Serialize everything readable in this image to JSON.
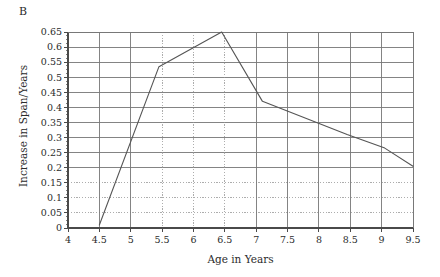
{
  "panel": {
    "label": "B"
  },
  "chart_data": {
    "type": "line",
    "title": "",
    "subtitle": "",
    "xlabel": "Age in Years",
    "ylabel": "Increase in Span/Years",
    "xlim": [
      4,
      9.5
    ],
    "ylim": [
      0,
      0.65
    ],
    "grid": true,
    "legend_position": "none",
    "xticks": [
      4,
      4.5,
      5,
      5.5,
      6,
      6.5,
      7,
      7.5,
      8,
      8.5,
      9,
      9.5
    ],
    "xticklabels": [
      "4",
      "4.5",
      "5",
      "5.5",
      "6",
      "6.5",
      "7",
      "7.5",
      "8",
      "8.5",
      "9",
      "9.5"
    ],
    "yticks": [
      0,
      0.05,
      0.1,
      0.15,
      0.2,
      0.25,
      0.3,
      0.35,
      0.4,
      0.45,
      0.5,
      0.55,
      0.6,
      0.65
    ],
    "yticklabels": [
      "0",
      "0.05",
      "0.1",
      "0.15",
      "0.2",
      "0.25",
      "0.3",
      "0.35",
      "0.4",
      "0.45",
      "0.5",
      "0.55",
      "0.6",
      "0.65"
    ],
    "dotted_ygrid": [
      0.05,
      0.1,
      0.15
    ],
    "dotted_xgrid": [
      5.5,
      6,
      6.5
    ],
    "series": [
      {
        "name": "Increase in Span",
        "color": "#555555",
        "x": [
          4.5,
          5.45,
          6.45,
          7.1,
          8.45,
          9.05,
          9.5
        ],
        "values": [
          0.01,
          0.535,
          0.65,
          0.42,
          0.31,
          0.265,
          0.205
        ]
      }
    ]
  },
  "colors": {
    "axis": "#4a4a4a",
    "grid_solid": "#777777",
    "grid_dotted": "#999999",
    "line": "#555555",
    "text": "#2b2b2b"
  }
}
